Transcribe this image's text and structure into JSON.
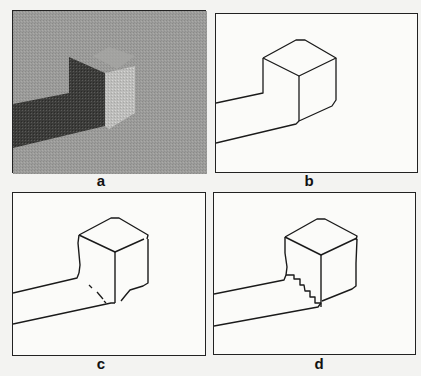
{
  "figure": {
    "panels": [
      {
        "id": "a",
        "label": "a",
        "description": "Shaded grayscale rendering of a cube on a step/ledge"
      },
      {
        "id": "b",
        "label": "b",
        "description": "Clean line drawing of cube and ledge edges"
      },
      {
        "id": "c",
        "label": "c",
        "description": "Detected edge drawing with gaps and a dashed occlusion line"
      },
      {
        "id": "d",
        "label": "d",
        "description": "Edge drawing with staircase-like jagged shadow boundary"
      }
    ],
    "colors": {
      "background": "#f3f3f1",
      "line": "#1a1a1a",
      "panel_a_gray": "#9a9a98",
      "panel_a_dark": "#3a3a38",
      "panel_a_light": "#c8c8c6"
    }
  }
}
